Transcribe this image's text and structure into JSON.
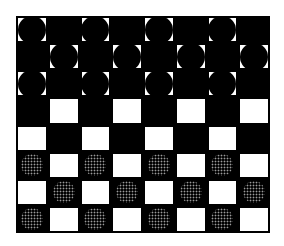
{
  "board": {
    "rows": 8,
    "cols": 8,
    "top_left_color": "light",
    "colors": {
      "light": "#ffffff",
      "dark": "#000000",
      "black_piece": "#000000",
      "dotted_piece_dots": "#9a9a9a"
    },
    "pieces": [
      {
        "row": 0,
        "col": 0,
        "type": "black"
      },
      {
        "row": 0,
        "col": 2,
        "type": "black"
      },
      {
        "row": 0,
        "col": 4,
        "type": "black"
      },
      {
        "row": 0,
        "col": 6,
        "type": "black"
      },
      {
        "row": 1,
        "col": 1,
        "type": "black"
      },
      {
        "row": 1,
        "col": 3,
        "type": "black"
      },
      {
        "row": 1,
        "col": 5,
        "type": "black"
      },
      {
        "row": 1,
        "col": 7,
        "type": "black"
      },
      {
        "row": 2,
        "col": 0,
        "type": "black"
      },
      {
        "row": 2,
        "col": 2,
        "type": "black"
      },
      {
        "row": 2,
        "col": 4,
        "type": "black"
      },
      {
        "row": 2,
        "col": 6,
        "type": "black"
      },
      {
        "row": 5,
        "col": 0,
        "type": "dotted"
      },
      {
        "row": 5,
        "col": 2,
        "type": "dotted"
      },
      {
        "row": 5,
        "col": 4,
        "type": "dotted"
      },
      {
        "row": 5,
        "col": 6,
        "type": "dotted"
      },
      {
        "row": 6,
        "col": 1,
        "type": "dotted"
      },
      {
        "row": 6,
        "col": 3,
        "type": "dotted"
      },
      {
        "row": 6,
        "col": 5,
        "type": "dotted"
      },
      {
        "row": 6,
        "col": 7,
        "type": "dotted"
      },
      {
        "row": 7,
        "col": 0,
        "type": "dotted"
      },
      {
        "row": 7,
        "col": 2,
        "type": "dotted"
      },
      {
        "row": 7,
        "col": 4,
        "type": "dotted"
      },
      {
        "row": 7,
        "col": 6,
        "type": "dotted"
      }
    ]
  }
}
